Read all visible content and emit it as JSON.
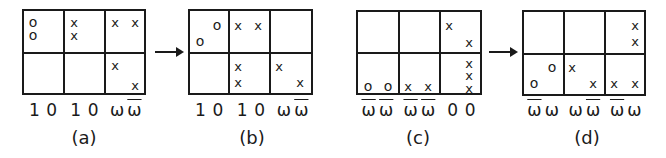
{
  "figure": {
    "panels": [
      {
        "caption": "(a)",
        "left": 22,
        "labels": [
          "1",
          "0",
          "1",
          "0",
          "ω",
          "ω̄"
        ],
        "label_bars": [
          false,
          false,
          false,
          false,
          false,
          true
        ],
        "marks": [
          {
            "t": "o",
            "x": 9,
            "y": 11
          },
          {
            "t": "o",
            "x": 9,
            "y": 24
          },
          {
            "t": "x",
            "x": 50,
            "y": 11
          },
          {
            "t": "x",
            "x": 50,
            "y": 24
          },
          {
            "t": "x",
            "x": 91,
            "y": 11
          },
          {
            "t": "x",
            "x": 111,
            "y": 11
          },
          {
            "t": "x",
            "x": 91,
            "y": 54
          },
          {
            "t": "x",
            "x": 111,
            "y": 74
          }
        ]
      },
      {
        "caption": "(b)",
        "left": 188,
        "labels": [
          "1",
          "0",
          "1",
          "0",
          "ω",
          "ω̄"
        ],
        "label_bars": [
          false,
          false,
          false,
          false,
          false,
          true
        ],
        "marks": [
          {
            "t": "o",
            "x": 27,
            "y": 14
          },
          {
            "t": "o",
            "x": 10,
            "y": 30
          },
          {
            "t": "x",
            "x": 48,
            "y": 14
          },
          {
            "t": "x",
            "x": 68,
            "y": 14
          },
          {
            "t": "x",
            "x": 48,
            "y": 55
          },
          {
            "t": "x",
            "x": 48,
            "y": 71
          },
          {
            "t": "x",
            "x": 89,
            "y": 55
          },
          {
            "t": "x",
            "x": 110,
            "y": 71
          }
        ]
      },
      {
        "caption": "(c)",
        "left": 356,
        "labels": [
          "ω̄",
          "ω̄",
          "ω̄",
          "ω̄",
          "0",
          "0"
        ],
        "label_bars": [
          true,
          true,
          true,
          true,
          false,
          false
        ],
        "marks": [
          {
            "t": "x",
            "x": 91,
            "y": 13
          },
          {
            "t": "x",
            "x": 111,
            "y": 30
          },
          {
            "t": "x",
            "x": 111,
            "y": 51
          },
          {
            "t": "x",
            "x": 111,
            "y": 63
          },
          {
            "t": "x",
            "x": 111,
            "y": 76
          },
          {
            "t": "o",
            "x": 10,
            "y": 74
          },
          {
            "t": "o",
            "x": 30,
            "y": 74
          },
          {
            "t": "x",
            "x": 50,
            "y": 74
          },
          {
            "t": "x",
            "x": 70,
            "y": 74
          }
        ]
      },
      {
        "caption": "(d)",
        "left": 522,
        "labels": [
          "ω̄",
          "ω",
          "ω",
          "ω̄",
          "ω̄",
          "ω"
        ],
        "label_bars": [
          true,
          false,
          false,
          true,
          true,
          false
        ],
        "marks": [
          {
            "t": "x",
            "x": 111,
            "y": 13
          },
          {
            "t": "x",
            "x": 111,
            "y": 29
          },
          {
            "t": "o",
            "x": 28,
            "y": 55
          },
          {
            "t": "o",
            "x": 10,
            "y": 71
          },
          {
            "t": "x",
            "x": 48,
            "y": 55
          },
          {
            "t": "x",
            "x": 69,
            "y": 71
          },
          {
            "t": "x",
            "x": 90,
            "y": 71
          },
          {
            "t": "x",
            "x": 111,
            "y": 71
          }
        ]
      }
    ],
    "arrows": [
      {
        "from": "(a)",
        "to": "(b)",
        "left": 155,
        "width": 27
      },
      {
        "from": "(c)",
        "to": "(d)",
        "left": 489,
        "width": 27
      }
    ]
  }
}
